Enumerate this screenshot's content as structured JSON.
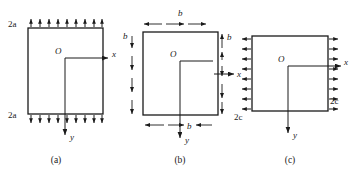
{
  "figure": {
    "type": "engineering-diagram",
    "background_color": "#ffffff",
    "line_color": "#1a1a1a",
    "panels": [
      {
        "id": "a",
        "caption": "(a)",
        "axes": {
          "origin_label": "O",
          "x_label": "x",
          "y_label": "y",
          "x_direction": "right",
          "y_direction": "down"
        },
        "loads": [
          {
            "edge": "top",
            "label": "2a",
            "arrow_direction": "up",
            "count": 9,
            "placement": "outside-pointing-in"
          },
          {
            "edge": "bottom",
            "label": "2a",
            "arrow_direction": "down",
            "count": 9,
            "placement": "outside-pointing-out"
          }
        ],
        "dimension_labels": [
          "2a",
          "2a"
        ]
      },
      {
        "id": "b",
        "caption": "(b)",
        "axes": {
          "origin_label": "O",
          "x_label": "x",
          "y_label": "y",
          "x_direction": "right",
          "y_direction": "down"
        },
        "loads": [],
        "dimensions": [
          {
            "edge": "top",
            "label": "b",
            "orientation": "horizontal"
          },
          {
            "edge": "left",
            "label": "b",
            "orientation": "vertical"
          },
          {
            "edge": "right",
            "label": "b",
            "orientation": "vertical"
          },
          {
            "edge": "bottom",
            "label": "b",
            "orientation": "horizontal"
          }
        ],
        "dimension_labels": [
          "b",
          "b",
          "b",
          "b"
        ]
      },
      {
        "id": "c",
        "caption": "(c)",
        "axes": {
          "origin_label": "O",
          "x_label": "x",
          "y_label": "y",
          "x_direction": "right",
          "y_direction": "down"
        },
        "loads": [
          {
            "edge": "left",
            "label": "2c",
            "arrow_direction": "left",
            "count": 8,
            "placement": "outward-tension"
          },
          {
            "edge": "right",
            "label": "2c",
            "arrow_direction": "right",
            "count": 8,
            "placement": "outward-tension"
          }
        ],
        "dimension_labels": [
          "2c",
          "2c"
        ]
      }
    ]
  },
  "labels": {
    "a_top": "2a",
    "a_bottom": "2a",
    "a_origin": "O",
    "a_x": "x",
    "a_y": "y",
    "a_caption": "(a)",
    "b_top": "b",
    "b_left": "b",
    "b_right": "b",
    "b_bottom": "b",
    "b_origin": "O",
    "b_x": "x",
    "b_y": "y",
    "b_caption": "(b)",
    "c_left": "2c",
    "c_right": "2c",
    "c_origin": "O",
    "c_x": "x",
    "c_y": "y",
    "c_caption": "(c)"
  }
}
